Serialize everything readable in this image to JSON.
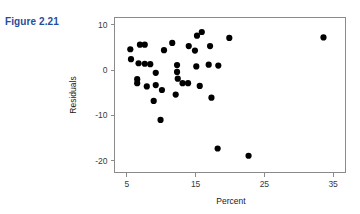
{
  "figure": {
    "caption": "Figure 2.21",
    "caption_color": "#1f4e9c"
  },
  "chart_data": {
    "type": "scatter",
    "title": "",
    "xlabel": "Percent",
    "ylabel": "Residuals",
    "xlim": [
      3.2,
      36.8
    ],
    "ylim": [
      -22.6,
      11.6
    ],
    "xticks": [
      5,
      15,
      25,
      35
    ],
    "xtick_labels": [
      "5",
      "15",
      "25",
      "35"
    ],
    "yticks": [
      10,
      0,
      -10,
      -20
    ],
    "ytick_labels": [
      "10",
      "0",
      "-10",
      "-20"
    ],
    "grid": false,
    "legend": false,
    "marker": "filled-circle",
    "marker_color": "#000000",
    "marker_size": 3.1,
    "frame": true,
    "points": [
      {
        "x": 5.5,
        "y": 4.6
      },
      {
        "x": 5.6,
        "y": 2.4
      },
      {
        "x": 6.9,
        "y": 5.6
      },
      {
        "x": 7.6,
        "y": 5.6
      },
      {
        "x": 6.7,
        "y": 1.5
      },
      {
        "x": 7.6,
        "y": 1.4
      },
      {
        "x": 8.4,
        "y": 1.3
      },
      {
        "x": 6.5,
        "y": -2.0
      },
      {
        "x": 6.5,
        "y": -2.9
      },
      {
        "x": 7.9,
        "y": -3.6
      },
      {
        "x": 9.2,
        "y": -0.6
      },
      {
        "x": 9.2,
        "y": -3.3
      },
      {
        "x": 10.1,
        "y": -4.4
      },
      {
        "x": 8.9,
        "y": -6.8
      },
      {
        "x": 9.9,
        "y": -11.0
      },
      {
        "x": 11.6,
        "y": 6.0
      },
      {
        "x": 10.4,
        "y": 4.4
      },
      {
        "x": 12.3,
        "y": 1.1
      },
      {
        "x": 12.3,
        "y": -0.4
      },
      {
        "x": 12.4,
        "y": -1.9
      },
      {
        "x": 12.1,
        "y": -5.4
      },
      {
        "x": 14.0,
        "y": 5.3
      },
      {
        "x": 13.1,
        "y": -2.9
      },
      {
        "x": 13.9,
        "y": -2.9
      },
      {
        "x": 15.2,
        "y": 7.6
      },
      {
        "x": 15.9,
        "y": 8.4
      },
      {
        "x": 14.9,
        "y": 4.3
      },
      {
        "x": 15.1,
        "y": 0.8
      },
      {
        "x": 15.6,
        "y": -3.5
      },
      {
        "x": 17.1,
        "y": 5.3
      },
      {
        "x": 16.9,
        "y": 1.2
      },
      {
        "x": 18.3,
        "y": 1.0
      },
      {
        "x": 17.3,
        "y": -6.1
      },
      {
        "x": 19.9,
        "y": 7.1
      },
      {
        "x": 18.2,
        "y": -17.3
      },
      {
        "x": 22.7,
        "y": -18.9
      },
      {
        "x": 33.6,
        "y": 7.2
      }
    ]
  }
}
